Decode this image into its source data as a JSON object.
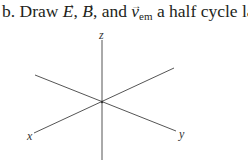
{
  "prompt": {
    "part_label": "b.",
    "text_before": "Draw",
    "vec_E": "E",
    "comma1": ",",
    "vec_B": "B",
    "and_text": ", and",
    "vec_v": "v",
    "v_subscript": "em",
    "text_after": "a half cycle later.",
    "arrow_glyph": "→"
  },
  "axes": {
    "z_label": "z",
    "x_label": "x",
    "y_label": "y",
    "line_color": "#555555"
  }
}
